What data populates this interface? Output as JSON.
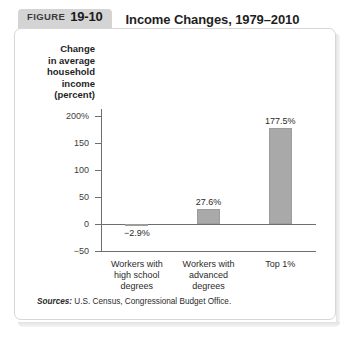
{
  "figure": {
    "label_word": "FIGURE",
    "number": "19-10",
    "title": "Income Changes, 1979–2010"
  },
  "source": {
    "label": "Sources:",
    "text": "U.S. Census, Congressional Budget Office."
  },
  "colors": {
    "bar_fill": "#a9a9a9",
    "badge_background": "#d4d4d4",
    "axis": "#6e6e6e",
    "panel_border": "#d6d6d6"
  },
  "chart_data": {
    "type": "bar",
    "title": "Income Changes, 1979–2010",
    "xlabel": "",
    "ylabel": "Change in average household income (percent)",
    "ylabel_lines": [
      "Change",
      "in average",
      "household",
      "income",
      "(percent)"
    ],
    "categories": [
      "Workers with high school degrees",
      "Workers with advanced degrees",
      "Top 1%"
    ],
    "category_lines": [
      [
        "Workers with",
        "high school",
        "degrees"
      ],
      [
        "Workers with",
        "advanced",
        "degrees"
      ],
      [
        "Top 1%"
      ]
    ],
    "values": [
      -2.9,
      27.6,
      177.5
    ],
    "data_labels": [
      "−2.9%",
      "27.6%",
      "177.5%"
    ],
    "ylim": [
      -50,
      200
    ],
    "yticks": [
      200,
      150,
      100,
      50,
      0,
      -50
    ],
    "ytick_labels": [
      "200%",
      "150",
      "100",
      "50",
      "0",
      "−50"
    ],
    "grid": false,
    "legend": false
  }
}
